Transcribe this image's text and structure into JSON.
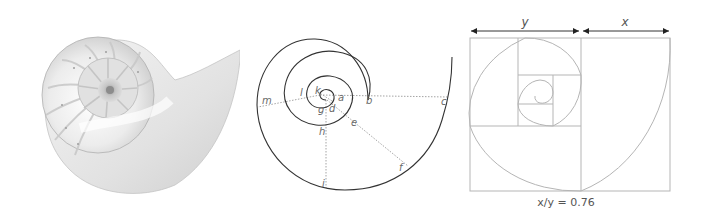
{
  "figure": {
    "panels": [
      {
        "id": "shell",
        "description": "Photograph of a cross-sectioned nautilus shell showing chambered spiral"
      },
      {
        "id": "spiral",
        "description": "Logarithmic spiral with radial dotted measurement lines"
      },
      {
        "id": "golden",
        "description": "Golden-rectangle subdivision with inscribed spiral"
      }
    ]
  },
  "spiral_diagram": {
    "labels": {
      "a": "a",
      "b": "b",
      "c": "c",
      "d": "d",
      "e": "e",
      "f": "f",
      "g": "g",
      "h": "h",
      "i": "i",
      "k": "k",
      "l": "l",
      "m": "m"
    }
  },
  "golden_diagram": {
    "top_labels": {
      "y": "y",
      "x": "x"
    },
    "caption": "x/y = 0.76"
  },
  "colors": {
    "spiral_stroke": "#333333",
    "dotted_line": "#9a9a9a",
    "golden_stroke": "#b5b5b5",
    "label": "#6a6a6a"
  }
}
